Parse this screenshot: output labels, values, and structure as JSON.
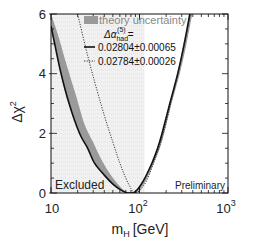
{
  "chart_data": {
    "type": "line",
    "title": "",
    "xlabel": "m_H [GeV]",
    "xlabel_main": "m",
    "xlabel_sub": "H",
    "xlabel_unit": "[GeV]",
    "ylabel": "Δχ²",
    "ylabel_main": "Δχ",
    "ylabel_sup": "2",
    "xscale": "log",
    "xlim": [
      10,
      1000
    ],
    "ylim": [
      0,
      6
    ],
    "x_ticks": [
      {
        "value": 10,
        "label": "10",
        "exp": ""
      },
      {
        "value": 100,
        "label": "10",
        "exp": "2"
      },
      {
        "value": 1000,
        "label": "10",
        "exp": "3"
      }
    ],
    "y_ticks": [
      {
        "value": 0,
        "label": "0"
      },
      {
        "value": 2,
        "label": "2"
      },
      {
        "value": 4,
        "label": "4"
      },
      {
        "value": 6,
        "label": "6"
      }
    ],
    "legend": {
      "band_label": "theory uncertainty",
      "header": "Δα_had^(5) =",
      "header_main": "Δα",
      "header_sub": "had",
      "header_sup": "(5)",
      "header_eq": "=",
      "entries": [
        {
          "style": "solid",
          "label": "0.02804±0.00065"
        },
        {
          "style": "dotted",
          "label": "0.02784±0.00026"
        }
      ]
    },
    "annotations": {
      "excluded": "Excluded",
      "preliminary": "Preliminary"
    },
    "excluded_region": {
      "x_max": 114,
      "note": "LEP direct search exclusion, shaded lightly"
    },
    "series": [
      {
        "name": "Δα_had = 0.02804±0.00065 (central)",
        "style": "solid",
        "x": [
          10,
          11,
          13,
          16,
          21,
          26,
          31,
          40,
          50,
          60,
          70,
          78,
          90,
          110,
          138,
          160,
          180,
          220,
          270,
          320,
          370
        ],
        "y": [
          5.6,
          5.0,
          4.0,
          3.0,
          2.0,
          1.5,
          1.0,
          0.6,
          0.3,
          0.12,
          0.02,
          0.0,
          0.05,
          0.4,
          1.0,
          1.5,
          2.0,
          3.0,
          4.0,
          5.0,
          6.0
        ]
      },
      {
        "name": "theory uncertainty band upper edge",
        "style": "band",
        "x": [
          10,
          12,
          15,
          19,
          24,
          30,
          36,
          45,
          55,
          65,
          75,
          82,
          95,
          115,
          145,
          170,
          190,
          230,
          285,
          340,
          395
        ],
        "y": [
          6.0,
          5.3,
          4.3,
          3.3,
          2.3,
          1.7,
          1.2,
          0.7,
          0.35,
          0.12,
          0.02,
          0.0,
          0.04,
          0.35,
          1.0,
          1.5,
          2.0,
          3.0,
          4.0,
          5.0,
          6.0
        ]
      },
      {
        "name": "Δα_had = 0.02784±0.00026",
        "style": "dotted",
        "x": [
          20,
          25,
          30,
          40,
          50,
          60,
          70,
          80,
          88,
          100,
          120,
          140,
          165,
          190,
          230,
          280,
          330,
          375
        ],
        "y": [
          6.0,
          4.8,
          3.9,
          2.6,
          1.7,
          1.0,
          0.5,
          0.15,
          0.0,
          0.08,
          0.4,
          0.9,
          1.5,
          2.1,
          3.1,
          4.2,
          5.2,
          6.0
        ]
      }
    ]
  }
}
